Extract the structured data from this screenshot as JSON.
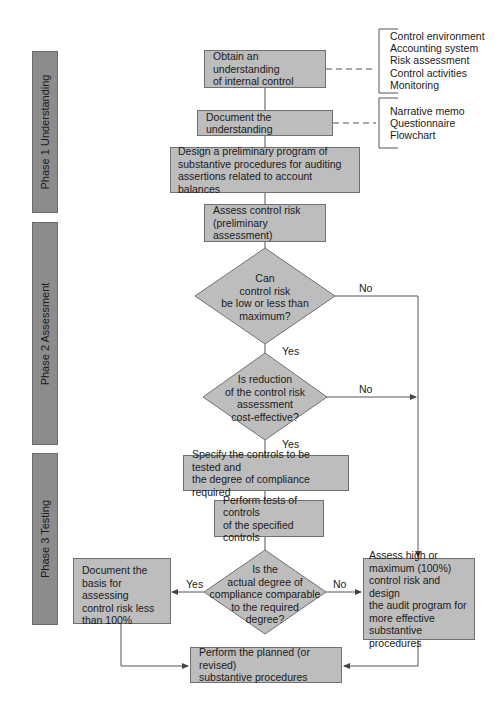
{
  "phases": [
    {
      "label": "Phase 1 Understanding"
    },
    {
      "label": "Phase 2 Assessment"
    },
    {
      "label": "Phase 3 Testing"
    }
  ],
  "boxes": {
    "obtain": [
      "Obtain an understanding",
      "of internal control"
    ],
    "document": [
      "Document the understanding"
    ],
    "design": [
      "Design a preliminary program of",
      "substantive procedures for auditing",
      "assertions related to account balances"
    ],
    "assess": [
      "Assess control risk",
      "(preliminary assessment)"
    ],
    "specify": [
      "Specify the controls to be tested and",
      "the degree of compliance required"
    ],
    "perform_tests": [
      "Perform tests of controls",
      "of the specified controls"
    ],
    "document_basis": [
      "Document the",
      "basis for assessing",
      "control risk less",
      "than 100%"
    ],
    "assess_high": [
      "Assess high or",
      "maximum (100%)",
      "control risk and design",
      "the audit program for",
      "more effective",
      "substantive procedures"
    ],
    "perform_planned": [
      "Perform the planned (or revised)",
      "substantive procedures"
    ]
  },
  "decisions": {
    "low_risk": [
      "Can",
      "control risk",
      "be low or less than",
      "maximum?"
    ],
    "cost_effective": [
      "Is reduction",
      "of the control risk",
      "assessment",
      "cost-effective?"
    ],
    "compliance": [
      "Is the",
      "actual degree of",
      "compliance comparable",
      "to the required",
      "degree?"
    ]
  },
  "edge_labels": {
    "yes": "Yes",
    "no": "No"
  },
  "annotations": {
    "internal_control_components": [
      "Control environment",
      "Accounting system",
      "Risk assessment",
      "Control activities",
      "Monitoring"
    ],
    "documentation_methods": [
      "Narrative memo",
      "Questionnaire",
      "Flowchart"
    ]
  },
  "colors": {
    "box_fill": "#bdbdbd",
    "phase_fill": "#8c8c8c",
    "line": "#555555"
  }
}
